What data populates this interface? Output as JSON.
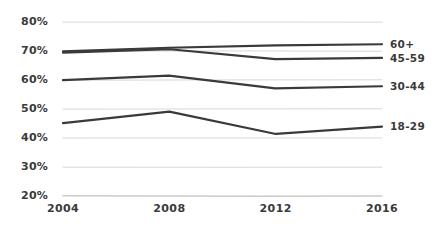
{
  "chart_data": {
    "type": "line",
    "title": "",
    "subtitle": "",
    "xlabel": "",
    "ylabel": "",
    "x": [
      2004,
      2008,
      2012,
      2016
    ],
    "categories": [
      "2004",
      "2008",
      "2012",
      "2016"
    ],
    "xtick_labels": [
      "2004",
      "2008",
      "2012",
      "2016"
    ],
    "ytick_labels": [
      "80%",
      "70%",
      "60%",
      "50%",
      "40%",
      "30%",
      "20%"
    ],
    "ytick_values": [
      80,
      70,
      60,
      50,
      40,
      30,
      20
    ],
    "ylim": [
      20,
      80
    ],
    "xlim": [
      2004,
      2016
    ],
    "grid": true,
    "grid_axis": "y",
    "legend_position": "right-inline",
    "series": [
      {
        "name": "60+",
        "label": "60+",
        "values": [
          70,
          71,
          72,
          72.5
        ],
        "color": "#3a3a3a"
      },
      {
        "name": "45-59",
        "label": "45-59",
        "values": [
          69.5,
          70.5,
          67,
          67.5
        ],
        "color": "#3a3a3a"
      },
      {
        "name": "30-44",
        "label": "30-44",
        "values": [
          60,
          61.5,
          57,
          58
        ],
        "color": "#3a3a3a"
      },
      {
        "name": "18-29",
        "label": "18-29",
        "values": [
          45,
          49,
          41.5,
          44
        ],
        "color": "#3a3a3a"
      }
    ],
    "style": {
      "line_color": "#3a3a3a",
      "grid_color": "#d8d8d8",
      "axis_color": "#cccccc",
      "background": "#ffffff",
      "line_width": 2.2,
      "hand_drawn": true
    }
  }
}
